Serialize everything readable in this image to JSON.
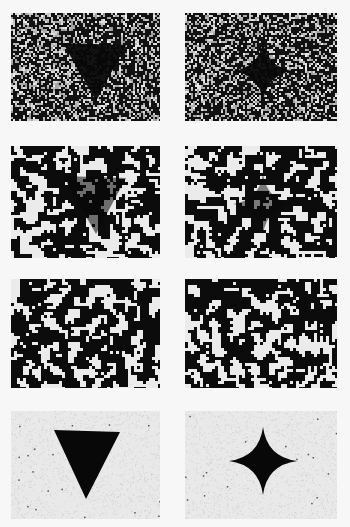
{
  "figure": {
    "background": "#f7f7f7",
    "panels": [
      {
        "row": 1,
        "col": 1,
        "shape": "triangle",
        "noise": "fine-speckle",
        "density": 0.62,
        "shape_opacity": 0.95,
        "x": 11,
        "y": 13,
        "w": 149,
        "h": 108
      },
      {
        "row": 1,
        "col": 2,
        "shape": "star4",
        "noise": "fine-speckle",
        "density": 0.62,
        "shape_opacity": 0.95,
        "x": 185,
        "y": 13,
        "w": 152,
        "h": 108
      },
      {
        "row": 2,
        "col": 1,
        "shape": "triangle",
        "noise": "coarse-blob",
        "density": 0.58,
        "shape_opacity": 0.55,
        "x": 11,
        "y": 146,
        "w": 149,
        "h": 112
      },
      {
        "row": 2,
        "col": 2,
        "shape": "star4",
        "noise": "coarse-blob",
        "density": 0.58,
        "shape_opacity": 0.5,
        "x": 185,
        "y": 146,
        "w": 152,
        "h": 112
      },
      {
        "row": 3,
        "col": 1,
        "shape": "none",
        "noise": "coarse-blob",
        "density": 0.55,
        "shape_opacity": 0,
        "x": 11,
        "y": 279,
        "w": 149,
        "h": 109
      },
      {
        "row": 3,
        "col": 2,
        "shape": "none",
        "noise": "coarse-blob",
        "density": 0.55,
        "shape_opacity": 0,
        "x": 185,
        "y": 279,
        "w": 152,
        "h": 109
      },
      {
        "row": 4,
        "col": 1,
        "shape": "triangle",
        "noise": "light-paper",
        "density": 0.04,
        "shape_opacity": 1,
        "x": 11,
        "y": 411,
        "w": 149,
        "h": 108
      },
      {
        "row": 4,
        "col": 2,
        "shape": "star4",
        "noise": "light-paper",
        "density": 0.05,
        "shape_opacity": 1,
        "x": 185,
        "y": 411,
        "w": 152,
        "h": 108
      }
    ]
  }
}
